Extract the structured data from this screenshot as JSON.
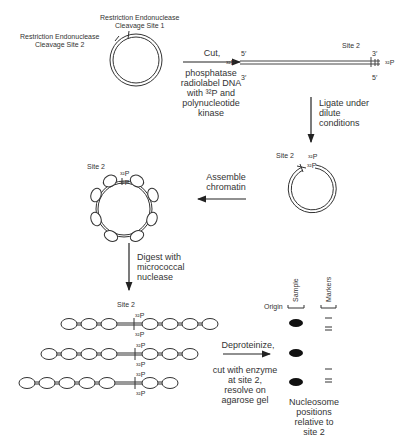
{
  "labels": {
    "site1": "Restriction Endonuclease\nCleavage Site 1",
    "site1_line1": "Restriction Endonuclease",
    "site1_line2": "Cleavage Site 1",
    "site2_line1": "Restriction Endonuclease",
    "site2_line2": "Cleavage Site 2",
    "site2_short": "Site 2",
    "p32": "³²P",
    "five_prime": "5′",
    "three_prime": "3′"
  },
  "steps": {
    "cut": {
      "title": "Cut,",
      "lines": [
        "phosphatase",
        "radiolabel DNA",
        "with ³²P and",
        "polynucleotide",
        "kinase"
      ]
    },
    "ligate": {
      "lines": [
        "Ligate under",
        "dilute",
        "conditions"
      ]
    },
    "assemble": {
      "lines": [
        "Assemble",
        "chromatin"
      ]
    },
    "digest": {
      "lines": [
        "Digest with",
        "micrococcal",
        "nuclease"
      ]
    },
    "deproteinize": {
      "title": "Deproteinize,",
      "lines": [
        "cut with enzyme",
        "at site 2,",
        "resolve on",
        "agarose gel"
      ]
    }
  },
  "gel": {
    "origin_label": "Origin",
    "lane_labels": [
      "Sample",
      "Markers"
    ],
    "caption": [
      "Nucleosome",
      "positions",
      "relative to",
      "site 2"
    ]
  },
  "colors": {
    "line": "#333333",
    "text": "#333333",
    "band": "#111111",
    "background": "#ffffff"
  }
}
